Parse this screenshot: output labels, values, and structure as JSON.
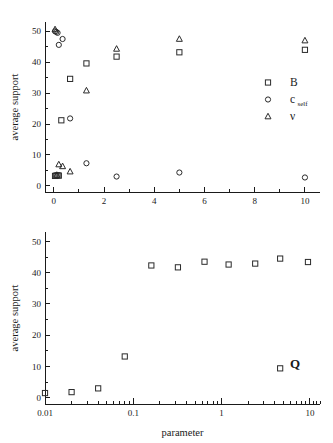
{
  "figure": {
    "title": "",
    "background": "#ffffff",
    "marker_color": "#2a2a2a"
  },
  "chart_data": [
    {
      "type": "scatter",
      "panel": "top",
      "title": "",
      "xlabel": "",
      "ylabel": "average support",
      "xscale": "linear",
      "yscale": "linear",
      "xlim": [
        -0.35,
        10.6
      ],
      "ylim": [
        -2,
        53
      ],
      "xticks": [
        0,
        2,
        4,
        6,
        8,
        10
      ],
      "xticklabels": [
        "0",
        "2",
        "4",
        "6",
        "8",
        "10"
      ],
      "xminorticks": [
        1,
        3,
        5,
        7,
        9
      ],
      "yticks": [
        0,
        10,
        20,
        30,
        40,
        50
      ],
      "yticklabels": [
        "0",
        "10",
        "20",
        "30",
        "40",
        "50"
      ],
      "yminorticks": [
        5,
        15,
        25,
        35,
        45
      ],
      "grid": false,
      "legend_position": "right",
      "series": [
        {
          "name": "B",
          "marker": "square",
          "points": [
            [
              0.05,
              3.2
            ],
            [
              0.1,
              3.3
            ],
            [
              0.15,
              3.4
            ],
            [
              0.2,
              3.3
            ],
            [
              0.3,
              21.2
            ],
            [
              0.65,
              34.6
            ],
            [
              1.3,
              39.6
            ],
            [
              2.5,
              41.8
            ],
            [
              5.0,
              43.2
            ],
            [
              10.0,
              44.0
            ]
          ]
        },
        {
          "name": "c_self",
          "marker": "circle",
          "points": [
            [
              0.05,
              50.0
            ],
            [
              0.1,
              49.8
            ],
            [
              0.15,
              49.5
            ],
            [
              0.2,
              45.6
            ],
            [
              0.35,
              47.5
            ],
            [
              0.65,
              21.8
            ],
            [
              1.3,
              7.3
            ],
            [
              2.5,
              3.0
            ],
            [
              5.0,
              4.3
            ],
            [
              10.0,
              2.7
            ]
          ]
        },
        {
          "name": "nu",
          "marker": "triangle",
          "points": [
            [
              0.05,
              50.6
            ],
            [
              0.12,
              3.5
            ],
            [
              0.2,
              6.9
            ],
            [
              0.35,
              6.3
            ],
            [
              0.65,
              4.6
            ],
            [
              1.3,
              30.8
            ],
            [
              2.5,
              44.3
            ],
            [
              5.0,
              47.5
            ],
            [
              10.0,
              47.0
            ]
          ]
        }
      ],
      "legend": [
        {
          "label": "B",
          "sub": "",
          "marker": "square"
        },
        {
          "label": "c",
          "sub": "self",
          "marker": "circle"
        },
        {
          "label": "ν",
          "sub": "",
          "marker": "triangle"
        }
      ]
    },
    {
      "type": "scatter",
      "panel": "bottom",
      "title": "",
      "xlabel": "parameter",
      "ylabel": "average support",
      "xscale": "log",
      "yscale": "linear",
      "xlim": [
        0.01,
        13
      ],
      "ylim": [
        -2,
        53
      ],
      "xticks": [
        0.01,
        0.1,
        1,
        10
      ],
      "xticklabels": [
        "0.01",
        "0.1",
        "1",
        "10"
      ],
      "yticks": [
        0,
        10,
        20,
        30,
        40,
        50
      ],
      "yticklabels": [
        "0",
        "10",
        "20",
        "30",
        "40",
        "50"
      ],
      "grid": false,
      "annotation": "Q",
      "series": [
        {
          "name": "Q",
          "marker": "square",
          "points": [
            [
              0.01,
              1.5
            ],
            [
              0.02,
              1.8
            ],
            [
              0.04,
              3.0
            ],
            [
              0.08,
              13.2
            ],
            [
              0.16,
              42.3
            ],
            [
              0.32,
              41.7
            ],
            [
              0.64,
              43.5
            ],
            [
              1.2,
              42.6
            ],
            [
              2.4,
              42.9
            ],
            [
              4.6,
              44.5
            ],
            [
              4.6,
              9.4
            ],
            [
              9.5,
              43.4
            ]
          ]
        }
      ],
      "legend": [
        {
          "label": "Q",
          "sub": "",
          "marker": "square"
        }
      ]
    }
  ]
}
